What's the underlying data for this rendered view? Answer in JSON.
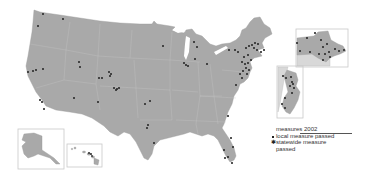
{
  "legend": {
    "title": "measures 2002",
    "items": [
      {
        "label": "local measure passed",
        "symbol": "small-dot"
      },
      {
        "label": "statewide measure passed",
        "symbol": "star-dot"
      }
    ]
  },
  "insets": [
    "alaska",
    "hawaii",
    "new-england",
    "new-jersey"
  ],
  "colors": {
    "land": "#a9a9a9",
    "inset_light": "#d8d8d8",
    "dot": "#2b2b2b",
    "background": "#ffffff"
  },
  "markers": [
    [
      43,
      14
    ],
    [
      63,
      19
    ],
    [
      38,
      26
    ],
    [
      28,
      72
    ],
    [
      33,
      71
    ],
    [
      36,
      70
    ],
    [
      43,
      69
    ],
    [
      79,
      62
    ],
    [
      80,
      67
    ],
    [
      99,
      78
    ],
    [
      102,
      78
    ],
    [
      109,
      72
    ],
    [
      111,
      74
    ],
    [
      110,
      76
    ],
    [
      114,
      88
    ],
    [
      117,
      89
    ],
    [
      119,
      88
    ],
    [
      116,
      90
    ],
    [
      40,
      100
    ],
    [
      42,
      102
    ],
    [
      44,
      109
    ],
    [
      74,
      98
    ],
    [
      98,
      102
    ],
    [
      145,
      104
    ],
    [
      150,
      101
    ],
    [
      148,
      125
    ],
    [
      147,
      128
    ],
    [
      154,
      143
    ],
    [
      163,
      46
    ],
    [
      194,
      42
    ],
    [
      197,
      47
    ],
    [
      184,
      63
    ],
    [
      186,
      65
    ],
    [
      188,
      66
    ],
    [
      195,
      59
    ],
    [
      207,
      64
    ],
    [
      229,
      50
    ],
    [
      235,
      50
    ],
    [
      238,
      52
    ],
    [
      246,
      48
    ],
    [
      249,
      46
    ],
    [
      252,
      45
    ],
    [
      255,
      43
    ],
    [
      258,
      44
    ],
    [
      254,
      48
    ],
    [
      257,
      50
    ],
    [
      261,
      52
    ],
    [
      264,
      50
    ],
    [
      248,
      55
    ],
    [
      244,
      57
    ],
    [
      242,
      62
    ],
    [
      245,
      64
    ],
    [
      248,
      63
    ],
    [
      251,
      60
    ],
    [
      246,
      68
    ],
    [
      249,
      70
    ],
    [
      243,
      71
    ],
    [
      240,
      74
    ],
    [
      247,
      74
    ],
    [
      242,
      78
    ],
    [
      236,
      85
    ],
    [
      228,
      116
    ],
    [
      231,
      138
    ],
    [
      233,
      147
    ],
    [
      228,
      157
    ],
    [
      225,
      158
    ],
    [
      232,
      163
    ],
    [
      224,
      150
    ],
    [
      297,
      43
    ],
    [
      307,
      38
    ],
    [
      315,
      33
    ],
    [
      321,
      40
    ],
    [
      323,
      47
    ],
    [
      327,
      44
    ],
    [
      329,
      52
    ],
    [
      335,
      49
    ],
    [
      339,
      51
    ],
    [
      344,
      50
    ],
    [
      319,
      54
    ],
    [
      325,
      54
    ],
    [
      323,
      60
    ],
    [
      330,
      57
    ],
    [
      300,
      51
    ],
    [
      310,
      52
    ],
    [
      283,
      76
    ],
    [
      286,
      78
    ],
    [
      291,
      77
    ],
    [
      292,
      82
    ],
    [
      293,
      84
    ],
    [
      290,
      86
    ],
    [
      294,
      88
    ],
    [
      292,
      93
    ],
    [
      285,
      98
    ],
    [
      282,
      104
    ],
    [
      285,
      108
    ]
  ]
}
